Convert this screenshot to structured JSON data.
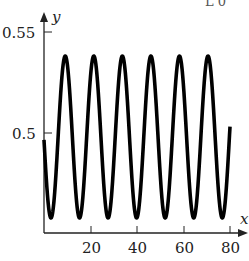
{
  "chart_data": {
    "type": "line",
    "title": "",
    "xlabel": "x",
    "ylabel": "y",
    "xlim": [
      0,
      80
    ],
    "ylim": [
      0.45,
      0.55
    ],
    "grid": false,
    "legend": null,
    "x_ticks": [
      20,
      40,
      60,
      80
    ],
    "x_tick_labels": [
      "20",
      "40",
      "60",
      "80"
    ],
    "y_ticks": [
      0.5,
      0.55
    ],
    "y_tick_labels": [
      "0.5",
      "0.55"
    ],
    "series": [
      {
        "name": "y(x)",
        "description": "Sinusoidal oscillation around ~0.498, amplitude ~0.04, period ~12.3",
        "model": {
          "center": 0.498,
          "amplitude": 0.0405,
          "period": 12.28,
          "phase_shift": -6.21
        },
        "x": [
          0,
          3.0,
          9.1,
          15.3,
          21.5,
          27.6,
          33.7,
          39.9,
          46.0,
          52.1,
          58.3,
          64.4,
          70.6,
          76.7,
          80
        ],
        "y": [
          0.495,
          0.4575,
          0.5385,
          0.4575,
          0.5385,
          0.4575,
          0.5385,
          0.4575,
          0.5385,
          0.4575,
          0.5385,
          0.4575,
          0.5385,
          0.4575,
          0.5025
        ]
      }
    ],
    "annotations": [
      "partially cropped text at top right"
    ]
  },
  "labels": {
    "x_axis": "x",
    "y_axis": "y",
    "y_tick_055": "0.55",
    "y_tick_05": "0.5",
    "x_tick_20": "20",
    "x_tick_40": "40",
    "x_tick_60": "60",
    "x_tick_80": "80",
    "top_crop_text": "L 0"
  }
}
